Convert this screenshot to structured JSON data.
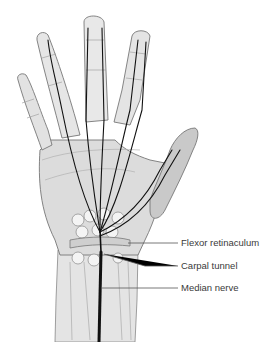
{
  "diagram": {
    "colors": {
      "skin_fill": "#dcdcdc",
      "skin_light": "#eeeeee",
      "thumb_fill": "#c9c9c9",
      "outline": "#777777",
      "nerve": "#111111",
      "bone_fill": "#f4f4f4",
      "label_text": "#3a3a3a",
      "leader_line": "#555555"
    },
    "labels": [
      {
        "id": "flexor-retinaculum",
        "text": "Flexor retinaculum"
      },
      {
        "id": "carpal-tunnel",
        "text": "Carpal tunnel"
      },
      {
        "id": "median-nerve",
        "text": "Median nerve"
      }
    ]
  }
}
